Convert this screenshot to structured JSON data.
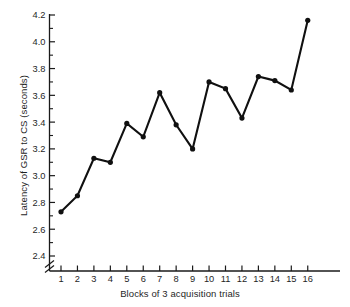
{
  "chart_data": {
    "type": "line",
    "title": "",
    "xlabel": "Blocks of 3 acquisition trials",
    "ylabel": "Latency of GSR to CS (seconds)",
    "x": [
      1,
      2,
      3,
      4,
      5,
      6,
      7,
      8,
      9,
      10,
      11,
      12,
      13,
      14,
      15,
      16
    ],
    "values": [
      2.73,
      2.85,
      3.13,
      3.1,
      3.39,
      3.29,
      3.62,
      3.38,
      3.2,
      3.7,
      3.65,
      3.43,
      3.74,
      3.71,
      3.64,
      4.16
    ],
    "xtick_labels": [
      "1",
      "2",
      "3",
      "4",
      "5",
      "6",
      "7",
      "8",
      "9",
      "10",
      "11",
      "12",
      "13",
      "14",
      "15",
      "16"
    ],
    "ytick_labels": [
      "2.4",
      "2.6",
      "2.8",
      "3.0",
      "3.2",
      "3.4",
      "3.6",
      "3.8",
      "4.0",
      "4.2"
    ],
    "ytick_values": [
      2.4,
      2.6,
      2.8,
      3.0,
      3.2,
      3.4,
      3.6,
      3.8,
      4.0,
      4.2
    ],
    "yminor_step": 0.1,
    "ylim": [
      2.4,
      4.2
    ],
    "xlim": [
      0.35,
      17.2
    ],
    "grid": false,
    "legend": null,
    "axis_break": true,
    "axis_break_note": "diagonal double-slash break on y-axis below 2.4",
    "marker": "filled-circle",
    "line_color": "#101010",
    "marker_color": "#101010",
    "background_color": "#ffffff"
  }
}
